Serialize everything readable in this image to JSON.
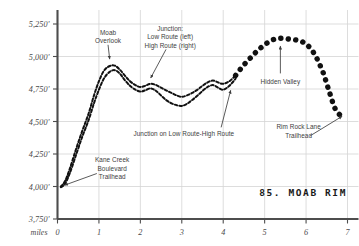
{
  "chart_data": {
    "type": "line",
    "title": "85. MOAB RIM",
    "xlabel": "miles",
    "ylabel": "",
    "xlim": [
      0,
      7
    ],
    "ylim": [
      3750,
      5250
    ],
    "grid": true,
    "legend": "none",
    "x_ticks": [
      0,
      1,
      2,
      3,
      4,
      5,
      6,
      7
    ],
    "x_tick_labels": [
      "0",
      "1",
      "2",
      "3",
      "4",
      "5",
      "6",
      "7"
    ],
    "y_ticks": [
      3750,
      4000,
      4250,
      4500,
      4750,
      5000,
      5250
    ],
    "y_tick_labels": [
      "3,750'",
      "4,000'",
      "4,250'",
      "4,500'",
      "4,750'",
      "5,000'",
      "5,250'"
    ],
    "series": [
      {
        "name": "High Route",
        "style": "dashed",
        "x": [
          0.08,
          0.18,
          0.3,
          0.45,
          0.6,
          0.75,
          0.88,
          1.0,
          1.12,
          1.25,
          1.38,
          1.5,
          1.62,
          1.75,
          1.88,
          2.0,
          2.12,
          2.25,
          2.38,
          2.5,
          2.62,
          2.75,
          2.88,
          3.0,
          3.12,
          3.25,
          3.38,
          3.5,
          3.62,
          3.75,
          3.88,
          4.0,
          4.15,
          4.3
        ],
        "y": [
          4000,
          4040,
          4140,
          4290,
          4430,
          4560,
          4700,
          4810,
          4890,
          4925,
          4930,
          4900,
          4855,
          4810,
          4780,
          4765,
          4775,
          4790,
          4780,
          4760,
          4740,
          4720,
          4700,
          4690,
          4700,
          4720,
          4745,
          4775,
          4800,
          4815,
          4800,
          4790,
          4810,
          4855
        ]
      },
      {
        "name": "Low Route",
        "style": "dashed",
        "x": [
          0.08,
          0.18,
          0.3,
          0.45,
          0.6,
          0.75,
          0.88,
          1.0,
          1.12,
          1.25,
          1.38,
          1.5,
          1.62,
          1.75,
          1.88,
          2.0,
          2.12,
          2.25,
          2.38,
          2.5,
          2.62,
          2.75,
          2.88,
          3.0,
          3.12,
          3.25,
          3.38,
          3.5,
          3.62,
          3.75,
          3.88,
          4.0,
          4.15,
          4.3
        ],
        "y": [
          3995,
          4020,
          4105,
          4245,
          4385,
          4510,
          4640,
          4745,
          4830,
          4880,
          4895,
          4870,
          4820,
          4775,
          4745,
          4730,
          4740,
          4755,
          4735,
          4700,
          4665,
          4640,
          4625,
          4620,
          4635,
          4665,
          4700,
          4735,
          4765,
          4780,
          4760,
          4745,
          4775,
          4830
        ]
      },
      {
        "name": "Combined Route",
        "style": "dotted-thick",
        "x": [
          4.3,
          4.42,
          4.54,
          4.66,
          4.78,
          4.9,
          5.02,
          5.14,
          5.26,
          5.38,
          5.5,
          5.62,
          5.74,
          5.86,
          5.98,
          6.1,
          6.22,
          6.32,
          6.42,
          6.5,
          6.58,
          6.64,
          6.7,
          6.76,
          6.82,
          6.88,
          6.94
        ],
        "y": [
          4855,
          4905,
          4950,
          4990,
          5030,
          5065,
          5095,
          5120,
          5135,
          5140,
          5138,
          5132,
          5128,
          5120,
          5100,
          5065,
          5010,
          4945,
          4870,
          4790,
          4710,
          4650,
          4600,
          4570,
          4550,
          4540,
          4535
        ]
      }
    ],
    "annotations": [
      {
        "id": "moab-overlook",
        "lines": [
          "Moab",
          "Overlook"
        ],
        "text_x": 1.22,
        "text_y": 5165,
        "arrow": {
          "x1": 1.22,
          "y1": 5090,
          "x2": 1.26,
          "y2": 4980
        },
        "align": "middle"
      },
      {
        "id": "junction-low-high",
        "lines": [
          "Junction:",
          "Low Route (left)",
          "High Route (right)"
        ],
        "text_x": 2.72,
        "text_y": 5195,
        "arrow": {
          "x1": 2.62,
          "y1": 5055,
          "x2": 2.25,
          "y2": 4835
        },
        "align": "middle"
      },
      {
        "id": "junction-on-low-route-high-route",
        "lines": [
          "Junction on Low Route-High Route"
        ],
        "text_x": 3.05,
        "text_y": 4385,
        "arrow": {
          "x1": 3.95,
          "y1": 4455,
          "x2": 4.18,
          "y2": 4740
        },
        "align": "middle"
      },
      {
        "id": "kane-creek-boulevard-trailhead",
        "lines": [
          "Kane Creek",
          "Boulevard",
          "Trailhead"
        ],
        "text_x": 1.32,
        "text_y": 4185,
        "arrow": {
          "x1": 0.95,
          "y1": 4100,
          "x2": 0.17,
          "y2": 4010
        },
        "align": "middle"
      },
      {
        "id": "hidden-valley",
        "lines": [
          "Hidden Valley"
        ],
        "text_x": 5.38,
        "text_y": 4790,
        "arrow": {
          "x1": 5.38,
          "y1": 4870,
          "x2": 5.38,
          "y2": 5080
        },
        "align": "middle"
      },
      {
        "id": "rim-rock-lane-trailhead",
        "lines": [
          "Rim Rock Lane",
          "Trailhead"
        ],
        "text_x": 5.82,
        "text_y": 4440,
        "arrow": {
          "x1": 6.1,
          "y1": 4390,
          "x2": 6.87,
          "y2": 4540
        },
        "align": "middle"
      }
    ],
    "colors": {
      "axis": "#4d4d4d",
      "grid": "#d4d4d4",
      "route": "#111111",
      "text": "#4a4a4a",
      "annotation": "#3d3d3d",
      "background": "#ffffff"
    }
  }
}
